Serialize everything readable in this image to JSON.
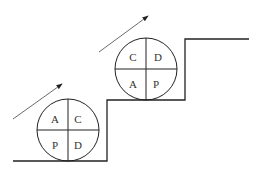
{
  "diagram": {
    "type": "PDCA staircase",
    "circles": [
      {
        "name": "lower-cycle",
        "quadrants": {
          "top_left": "A",
          "top_right": "C",
          "bottom_left": "P",
          "bottom_right": "D"
        }
      },
      {
        "name": "upper-cycle",
        "quadrants": {
          "top_left": "C",
          "top_right": "D",
          "bottom_left": "A",
          "bottom_right": "P"
        }
      }
    ],
    "line_color": "#222222"
  }
}
